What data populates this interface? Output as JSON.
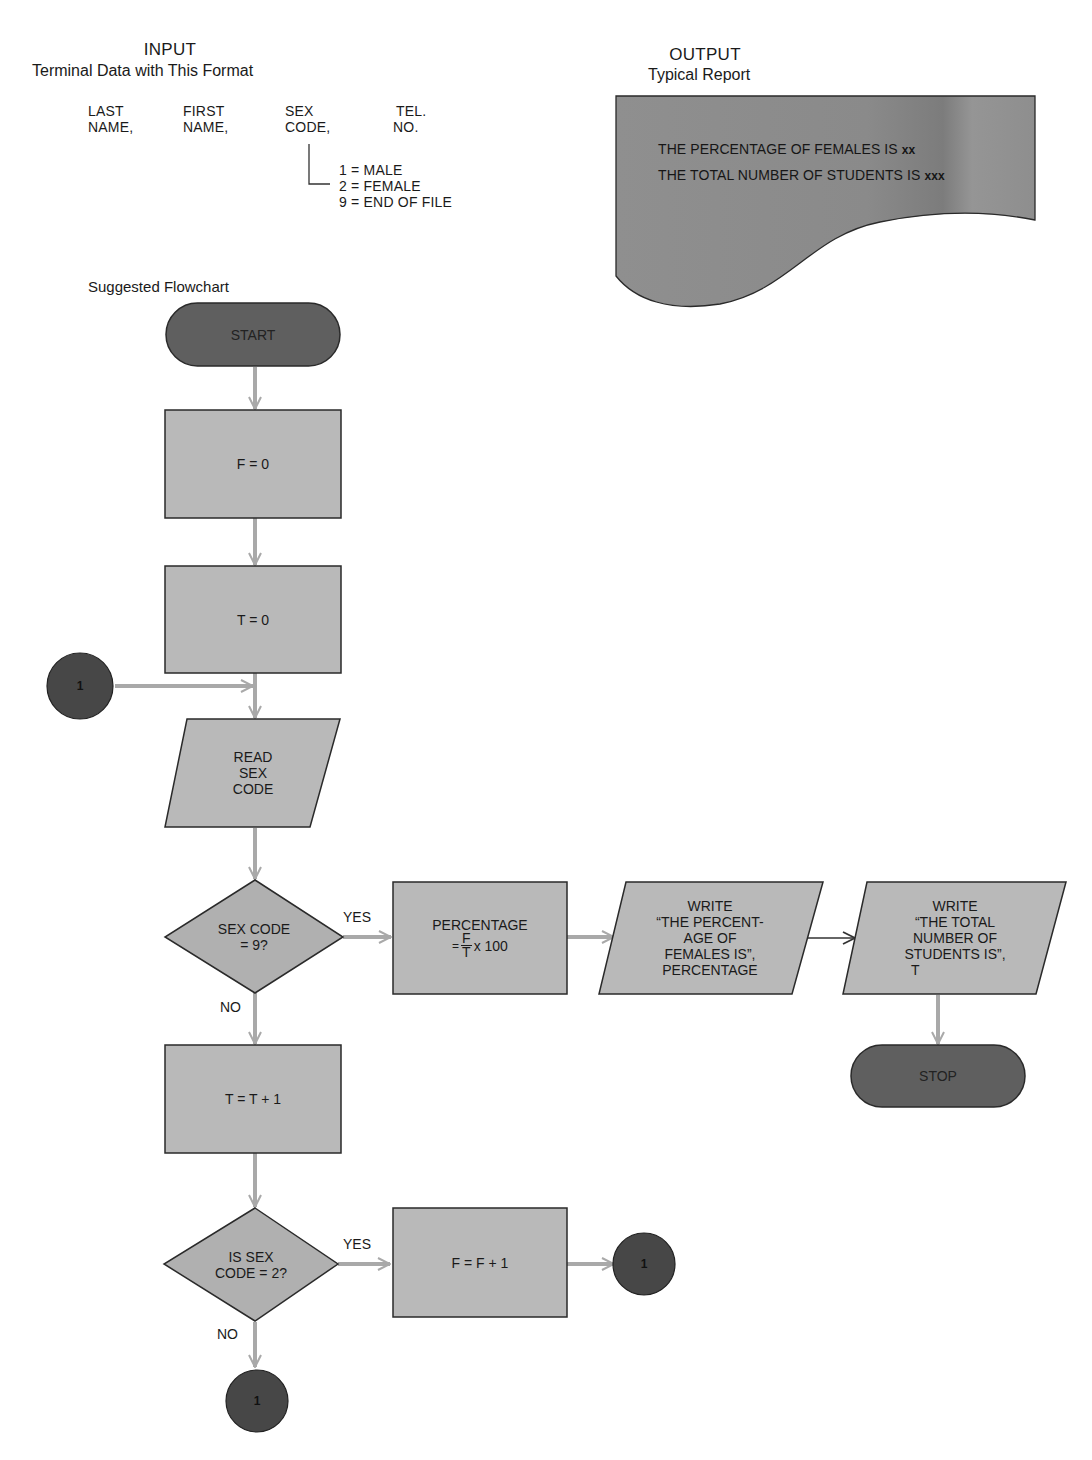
{
  "input": {
    "title": "INPUT",
    "subtitle": "Terminal Data with This Format",
    "fields": [
      {
        "line1": "LAST",
        "line2": "NAME,"
      },
      {
        "line1": "FIRST",
        "line2": "NAME,"
      },
      {
        "line1": "SEX",
        "line2": "CODE,"
      },
      {
        "line1": "TEL.",
        "line2": "NO."
      }
    ],
    "sex_codes": [
      "1 = MALE",
      "2 = FEMALE",
      "9 = END OF FILE"
    ]
  },
  "output": {
    "title": "OUTPUT",
    "subtitle": "Typical Report",
    "report_lines": [
      {
        "text": "THE PERCENTAGE OF FEMALES IS ",
        "placeholder": "xx"
      },
      {
        "text": "THE TOTAL NUMBER OF STUDENTS IS ",
        "placeholder": "xxx"
      }
    ]
  },
  "flowchart": {
    "label": "Suggested Flowchart",
    "colors": {
      "terminal_fill": "#5f5f5f",
      "process_fill": "#b9b9b9",
      "connector_fill": "#474747",
      "report_fill": "#8a8a8a",
      "arrow": "#a9a9a9",
      "outline": "#2a2a2a"
    },
    "nodes": {
      "start": {
        "type": "terminal",
        "label": "START"
      },
      "init_f": {
        "type": "process",
        "label": "F = 0"
      },
      "init_t": {
        "type": "process",
        "label": "T = 0"
      },
      "connector_in": {
        "type": "connector",
        "label": "1"
      },
      "read": {
        "type": "input",
        "lines": [
          "READ",
          "SEX",
          "CODE"
        ]
      },
      "decision_eof": {
        "type": "decision",
        "lines": [
          "SEX CODE",
          "= 9?"
        ]
      },
      "calc_pct": {
        "type": "process",
        "line1": "PERCENTAGE",
        "eq": "=",
        "num": "F",
        "den": "T",
        "tail": "x 100"
      },
      "write_pct": {
        "type": "output",
        "lines": [
          "WRITE",
          "“THE PERCENT-",
          "AGE OF",
          "FEMALES IS”,",
          "PERCENTAGE"
        ]
      },
      "write_total": {
        "type": "output",
        "lines": [
          "WRITE",
          "“THE TOTAL",
          "NUMBER OF",
          "STUDENTS IS”,",
          "T"
        ]
      },
      "stop": {
        "type": "terminal",
        "label": "STOP"
      },
      "incr_t": {
        "type": "process",
        "label": "T = T + 1"
      },
      "decision_female": {
        "type": "decision",
        "lines": [
          "IS SEX",
          "CODE = 2?"
        ]
      },
      "incr_f": {
        "type": "process",
        "label": "F = F + 1"
      },
      "connector_out_yes": {
        "type": "connector",
        "label": "1"
      },
      "connector_out_no": {
        "type": "connector",
        "label": "1"
      }
    },
    "branch_labels": {
      "eof_yes": "YES",
      "eof_no": "NO",
      "female_yes": "YES",
      "female_no": "NO"
    }
  }
}
